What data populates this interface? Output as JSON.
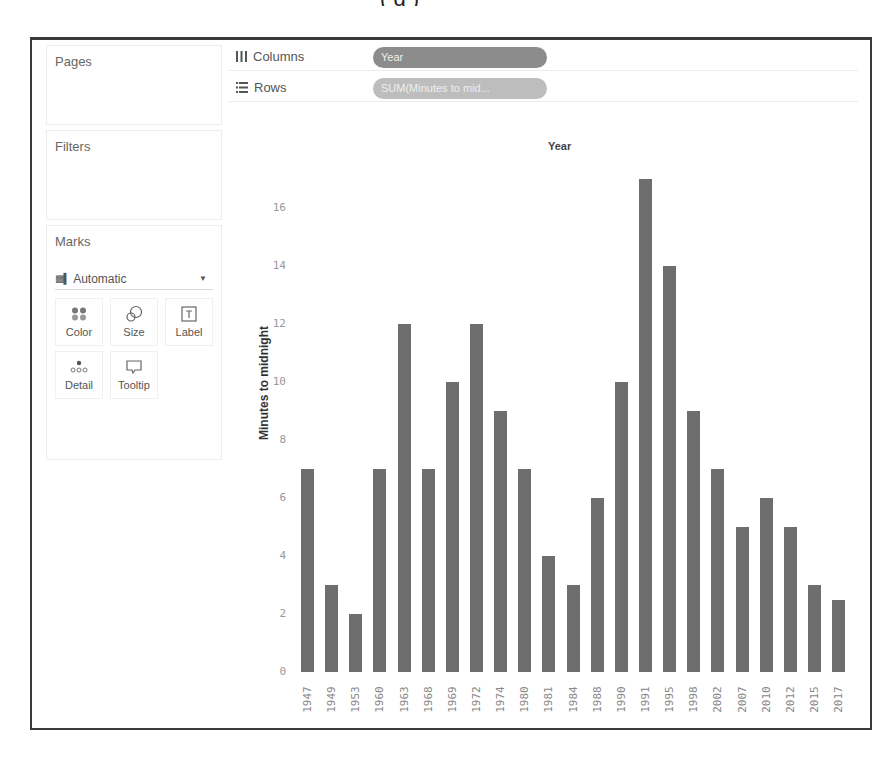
{
  "cutoff_caption": "(      g                                                )",
  "left_panel": {
    "pages_title": "Pages",
    "filters_title": "Filters",
    "marks_title": "Marks",
    "marks_type": "Automatic",
    "mark_buttons": [
      {
        "label": "Color",
        "icon": "color-dots-icon"
      },
      {
        "label": "Size",
        "icon": "size-circles-icon"
      },
      {
        "label": "Label",
        "icon": "label-text-icon"
      },
      {
        "label": "Detail",
        "icon": "detail-icon"
      },
      {
        "label": "Tooltip",
        "icon": "tooltip-icon"
      }
    ]
  },
  "shelves": {
    "columns_label": "Columns",
    "columns_pill": "Year",
    "rows_label": "Rows",
    "rows_pill": "SUM(Minutes to mid..."
  },
  "colors": {
    "bar": "#6e6e6e",
    "dimension_pill": "#8c8c8c",
    "measure_pill": "#bdbdbd"
  },
  "chart_data": {
    "type": "bar",
    "title": "Year",
    "xlabel": "Year",
    "ylabel": "Minutes to midnight",
    "categories": [
      "1947",
      "1949",
      "1953",
      "1960",
      "1963",
      "1968",
      "1969",
      "1972",
      "1974",
      "1980",
      "1981",
      "1984",
      "1988",
      "1990",
      "1991",
      "1995",
      "1998",
      "2002",
      "2007",
      "2010",
      "2012",
      "2015",
      "2017"
    ],
    "values": [
      7,
      3,
      2,
      7,
      12,
      7,
      10,
      12,
      9,
      7,
      4,
      3,
      6,
      10,
      17,
      14,
      9,
      7,
      5,
      6,
      5,
      3,
      2.5
    ],
    "y_ticks": [
      0,
      2,
      4,
      6,
      8,
      10,
      12,
      14,
      16
    ],
    "ylim": [
      0,
      17.5
    ],
    "grid": false,
    "legend": "none"
  }
}
